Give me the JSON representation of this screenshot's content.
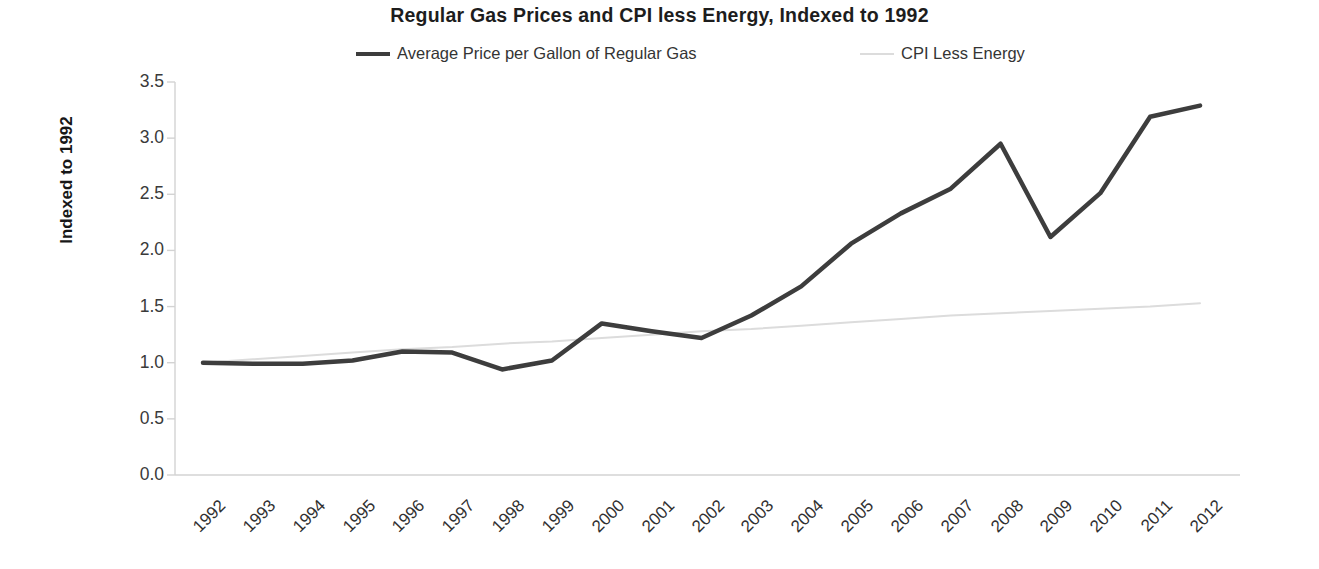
{
  "chart_data": {
    "type": "line",
    "title": "Regular Gas Prices and CPI less Energy, Indexed to 1992",
    "xlabel": "",
    "ylabel": "Indexed to 1992",
    "ylim": [
      0.0,
      3.5
    ],
    "yticks": [
      "0.0",
      "0.5",
      "1.0",
      "1.5",
      "2.0",
      "2.5",
      "3.0",
      "3.5"
    ],
    "ytick_values": [
      0.0,
      0.5,
      1.0,
      1.5,
      2.0,
      2.5,
      3.0,
      3.5
    ],
    "grid": false,
    "legend_position": "top-center",
    "categories": [
      "1992",
      "1993",
      "1994",
      "1995",
      "1996",
      "1997",
      "1998",
      "1999",
      "2000",
      "2001",
      "2002",
      "2003",
      "2004",
      "2005",
      "2006",
      "2007",
      "2008",
      "2009",
      "2010",
      "2011",
      "2012"
    ],
    "series": [
      {
        "name": "Average Price per Gallon of Regular Gas",
        "color": "#3d3d3d",
        "width": 4.5,
        "values": [
          1.0,
          0.99,
          0.99,
          1.02,
          1.1,
          1.09,
          0.94,
          1.02,
          1.35,
          1.28,
          1.22,
          1.42,
          1.68,
          2.06,
          2.33,
          2.55,
          2.95,
          2.12,
          2.51,
          3.19,
          3.29
        ]
      },
      {
        "name": "CPI Less Energy",
        "color": "#dcdcdc",
        "width": 2.0,
        "values": [
          1.0,
          1.03,
          1.06,
          1.09,
          1.12,
          1.14,
          1.17,
          1.19,
          1.22,
          1.25,
          1.28,
          1.3,
          1.33,
          1.36,
          1.39,
          1.42,
          1.44,
          1.46,
          1.48,
          1.5,
          1.53
        ]
      }
    ]
  },
  "legend": {
    "entries": [
      {
        "label": "Average Price per Gallon of Regular Gas",
        "color": "#3d3d3d"
      },
      {
        "label": "CPI Less Energy",
        "color": "#dcdcdc"
      }
    ]
  },
  "axis": {
    "line_color": "#d3d3d3"
  }
}
